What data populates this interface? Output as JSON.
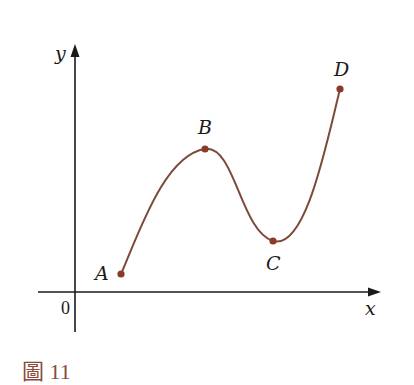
{
  "figure": {
    "caption_prefix": "圖",
    "caption_number": "11",
    "axes": {
      "x_label": "x",
      "y_label": "y",
      "origin_label": "0"
    },
    "points": [
      {
        "label": "A",
        "x": 121,
        "y": 274
      },
      {
        "label": "B",
        "x": 205,
        "y": 149
      },
      {
        "label": "C",
        "x": 273,
        "y": 241
      },
      {
        "label": "D",
        "x": 340,
        "y": 89
      }
    ],
    "colors": {
      "curve": "#7b4a3a",
      "point": "#8b3a2a",
      "axis": "#1a1a1a",
      "caption": "#8a4a3a"
    }
  }
}
